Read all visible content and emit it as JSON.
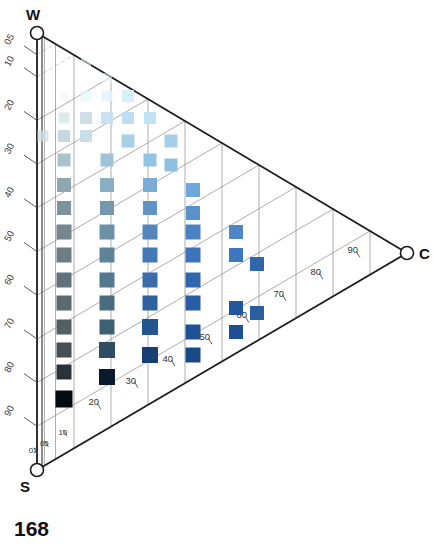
{
  "figure": {
    "number_label": "168",
    "type": "ternary-diagram",
    "background": "#ffffff"
  },
  "vertices": [
    {
      "id": "W",
      "label": "W",
      "name": "water-vertex",
      "x": 37,
      "y": 33
    },
    {
      "id": "C",
      "label": "C",
      "name": "cement-vertex",
      "x": 407,
      "y": 253
    },
    {
      "id": "S",
      "label": "S",
      "name": "sand-vertex",
      "x": 37,
      "y": 470
    }
  ],
  "axes": {
    "left": {
      "name": "left-axis",
      "from": "W",
      "to": "S",
      "tick_labels": [
        "05",
        "10",
        "20",
        "30",
        "40",
        "50",
        "60",
        "70",
        "80",
        "90"
      ],
      "tick_values": [
        5,
        10,
        20,
        30,
        40,
        50,
        60,
        70,
        80,
        90
      ],
      "label_rotation_deg": -62
    },
    "bottom": {
      "name": "bottom-axis",
      "from": "S",
      "to": "C",
      "tick_labels": [
        "02",
        "05",
        "10",
        "20",
        "30",
        "40",
        "50",
        "60",
        "70",
        "80",
        "90"
      ],
      "tick_values": [
        2,
        5,
        10,
        20,
        30,
        40,
        50,
        60,
        70,
        80,
        90
      ]
    },
    "hypotenuse": {
      "name": "top-axis",
      "from": "W",
      "to": "C"
    }
  },
  "colors": {
    "axis_stroke": "#1b1b1b",
    "grid_stroke": "#8a8a8a",
    "grid_faint": "#b9b9b9",
    "text": "#111111",
    "lightest_marker": "#e8f4fb",
    "mid_grey_marker": "#7b8e96",
    "mid_blue_marker": "#5b8fc9",
    "strong_blue_marker": "#2b5fa8",
    "darkest_marker": "#050a10"
  },
  "chart_data": {
    "type": "scatter",
    "title": "",
    "subtitle": "",
    "xlabel": "C",
    "ylabel": "W",
    "zlabel": "S",
    "legend": [],
    "grid": true,
    "marker_shape": "square",
    "columns_pct": [
      5,
      10,
      20,
      30,
      40,
      50,
      60,
      70
    ],
    "rows_pct": [
      5,
      10,
      20,
      30,
      40,
      50,
      60,
      70,
      80,
      90
    ],
    "points": [
      {
        "x": 86,
        "y": 62,
        "size": 10,
        "color": "#f4fbfe",
        "opacity": 0.55
      },
      {
        "x": 107,
        "y": 78,
        "size": 10,
        "color": "#f1fafd",
        "opacity": 0.5
      },
      {
        "x": 64,
        "y": 96,
        "size": 10,
        "color": "#f2fafd",
        "opacity": 0.5
      },
      {
        "x": 86,
        "y": 96,
        "size": 11,
        "color": "#e6f5fb",
        "opacity": 0.75
      },
      {
        "x": 107,
        "y": 96,
        "size": 11,
        "color": "#e3f3fb",
        "opacity": 0.8
      },
      {
        "x": 128,
        "y": 96,
        "size": 12,
        "color": "#d6edf8",
        "opacity": 0.9
      },
      {
        "x": 64,
        "y": 118,
        "size": 11,
        "color": "#d9e6e8",
        "opacity": 0.85
      },
      {
        "x": 86,
        "y": 118,
        "size": 12,
        "color": "#c9dde2",
        "opacity": 0.9
      },
      {
        "x": 107,
        "y": 118,
        "size": 12,
        "color": "#c3dff0",
        "opacity": 0.92
      },
      {
        "x": 128,
        "y": 118,
        "size": 12,
        "color": "#bbdcf1",
        "opacity": 0.95
      },
      {
        "x": 150,
        "y": 118,
        "size": 12,
        "color": "#bfe0f3",
        "opacity": 0.95
      },
      {
        "x": 43,
        "y": 136,
        "size": 11,
        "color": "#cfdde0",
        "opacity": 0.75
      },
      {
        "x": 64,
        "y": 136,
        "size": 12,
        "color": "#bdd3d8",
        "opacity": 0.9
      },
      {
        "x": 86,
        "y": 136,
        "size": 12,
        "color": "#c5dce6",
        "opacity": 0.9
      },
      {
        "x": 128,
        "y": 141,
        "size": 13,
        "color": "#a8cfe8",
        "opacity": 1
      },
      {
        "x": 171,
        "y": 141,
        "size": 13,
        "color": "#a7cfe9",
        "opacity": 1
      },
      {
        "x": 64,
        "y": 160,
        "size": 13,
        "color": "#a9c2c9",
        "opacity": 1
      },
      {
        "x": 107,
        "y": 160,
        "size": 13,
        "color": "#9fc3d8",
        "opacity": 1
      },
      {
        "x": 150,
        "y": 160,
        "size": 13,
        "color": "#93c2e2",
        "opacity": 1
      },
      {
        "x": 171,
        "y": 165,
        "size": 13,
        "color": "#8fc0e2",
        "opacity": 1
      },
      {
        "x": 64,
        "y": 185,
        "size": 14,
        "color": "#8fa7b0",
        "opacity": 1
      },
      {
        "x": 107,
        "y": 185,
        "size": 14,
        "color": "#8aaec3",
        "opacity": 1
      },
      {
        "x": 150,
        "y": 185,
        "size": 14,
        "color": "#7cabd3",
        "opacity": 1
      },
      {
        "x": 193,
        "y": 190,
        "size": 14,
        "color": "#6ea7dc",
        "opacity": 1
      },
      {
        "x": 64,
        "y": 208,
        "size": 14,
        "color": "#7d949d",
        "opacity": 1
      },
      {
        "x": 107,
        "y": 208,
        "size": 14,
        "color": "#7397ae",
        "opacity": 1
      },
      {
        "x": 150,
        "y": 208,
        "size": 14,
        "color": "#6392c4",
        "opacity": 1
      },
      {
        "x": 193,
        "y": 213,
        "size": 14,
        "color": "#5a90cc",
        "opacity": 1
      },
      {
        "x": 64,
        "y": 232,
        "size": 15,
        "color": "#74878f",
        "opacity": 1
      },
      {
        "x": 107,
        "y": 232,
        "size": 15,
        "color": "#6b8fa5",
        "opacity": 1
      },
      {
        "x": 150,
        "y": 232,
        "size": 15,
        "color": "#5386bd",
        "opacity": 1
      },
      {
        "x": 193,
        "y": 232,
        "size": 15,
        "color": "#4a83c4",
        "opacity": 1
      },
      {
        "x": 236,
        "y": 232,
        "size": 14,
        "color": "#4e86c7",
        "opacity": 1
      },
      {
        "x": 64,
        "y": 255,
        "size": 15,
        "color": "#6b7d85",
        "opacity": 1
      },
      {
        "x": 107,
        "y": 255,
        "size": 15,
        "color": "#5f8499",
        "opacity": 1
      },
      {
        "x": 150,
        "y": 255,
        "size": 15,
        "color": "#4579b5",
        "opacity": 1
      },
      {
        "x": 193,
        "y": 255,
        "size": 15,
        "color": "#3b74bb",
        "opacity": 1
      },
      {
        "x": 236,
        "y": 255,
        "size": 14,
        "color": "#3f77be",
        "opacity": 1
      },
      {
        "x": 257,
        "y": 264,
        "size": 14,
        "color": "#2f66ad",
        "opacity": 1
      },
      {
        "x": 64,
        "y": 280,
        "size": 15,
        "color": "#61737a",
        "opacity": 1
      },
      {
        "x": 107,
        "y": 280,
        "size": 15,
        "color": "#54788d",
        "opacity": 1
      },
      {
        "x": 150,
        "y": 280,
        "size": 15,
        "color": "#3a6daa",
        "opacity": 1
      },
      {
        "x": 193,
        "y": 280,
        "size": 15,
        "color": "#2f68b0",
        "opacity": 1
      },
      {
        "x": 64,
        "y": 303,
        "size": 15,
        "color": "#58696f",
        "opacity": 1
      },
      {
        "x": 107,
        "y": 303,
        "size": 15,
        "color": "#496c80",
        "opacity": 1
      },
      {
        "x": 150,
        "y": 303,
        "size": 15,
        "color": "#2e619d",
        "opacity": 1
      },
      {
        "x": 193,
        "y": 303,
        "size": 15,
        "color": "#265da5",
        "opacity": 1
      },
      {
        "x": 236,
        "y": 308,
        "size": 14,
        "color": "#21579e",
        "opacity": 1
      },
      {
        "x": 257,
        "y": 313,
        "size": 14,
        "color": "#27609f",
        "opacity": 1
      },
      {
        "x": 64,
        "y": 327,
        "size": 15,
        "color": "#4f5f64",
        "opacity": 1
      },
      {
        "x": 107,
        "y": 327,
        "size": 15,
        "color": "#3e6073",
        "opacity": 1
      },
      {
        "x": 150,
        "y": 327,
        "size": 16,
        "color": "#23558f",
        "opacity": 1
      },
      {
        "x": 193,
        "y": 332,
        "size": 15,
        "color": "#1d5297",
        "opacity": 1
      },
      {
        "x": 236,
        "y": 332,
        "size": 14,
        "color": "#1c5093",
        "opacity": 1
      },
      {
        "x": 64,
        "y": 350,
        "size": 15,
        "color": "#454f54",
        "opacity": 1
      },
      {
        "x": 107,
        "y": 350,
        "size": 16,
        "color": "#2f4d60",
        "opacity": 1
      },
      {
        "x": 150,
        "y": 355,
        "size": 16,
        "color": "#163f74",
        "opacity": 1
      },
      {
        "x": 193,
        "y": 355,
        "size": 15,
        "color": "#184a85",
        "opacity": 1
      },
      {
        "x": 64,
        "y": 372,
        "size": 15,
        "color": "#2c3338",
        "opacity": 1
      },
      {
        "x": 107,
        "y": 377,
        "size": 16,
        "color": "#0b1a2b",
        "opacity": 1
      },
      {
        "x": 64,
        "y": 399,
        "size": 17,
        "color": "#050a10",
        "opacity": 1
      }
    ]
  }
}
